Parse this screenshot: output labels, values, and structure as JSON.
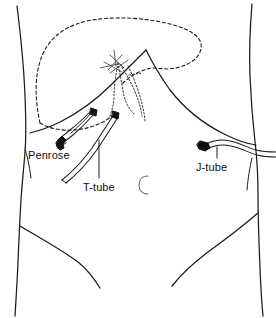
{
  "figure": {
    "view": "anterior abdominal wall",
    "background_color": "#ffffff",
    "line_color": "#1c1c1c",
    "drain_fill_color": "#121212"
  },
  "labels": {
    "penrose": "Penrose",
    "ttube": "T-tube",
    "jtube": "J-tube"
  },
  "anatomy": {
    "liver_outline": "dashed liver silhouette in right upper quadrant",
    "costal_margin": "solid inverted-V costal margin with xiphoid apex",
    "bile_duct": "dotted common bile duct and hepatic duct branches",
    "umbilicus": "C",
    "torso": "solid torso, flank and inguinal contour lines"
  },
  "devices": [
    {
      "name": "Penrose",
      "type": "flat soft drain",
      "exit_site": "right subcostal incision",
      "tip_style": "folded dark ribbon end"
    },
    {
      "name": "T-tube",
      "type": "biliary T-tube",
      "exit_site": "right upper quadrant, inferolateral",
      "tip_style": "double-lumen tubing curving inferolaterally"
    },
    {
      "name": "J-tube",
      "type": "jejunostomy feeding tube",
      "exit_site": "left upper quadrant",
      "tip_style": "dark hub at abdominal wall exit"
    }
  ]
}
